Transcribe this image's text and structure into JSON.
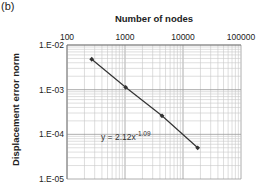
{
  "panel_label": "(b)",
  "chart_data": {
    "type": "line",
    "title": "",
    "xlabel": "Number of nodes",
    "ylabel": "Displacement error norm",
    "xscale": "log",
    "yscale": "log",
    "xlim": [
      100,
      100000
    ],
    "ylim": [
      1e-05,
      0.01
    ],
    "x_ticks": [
      "100",
      "1000",
      "10000",
      "100000"
    ],
    "y_ticks": [
      "1.E-02",
      "1.E-03",
      "1.E-04",
      "1.E-05"
    ],
    "grid": true,
    "legend": null,
    "series": [
      {
        "name": "Displacement error",
        "x": [
          267,
          1025,
          4350,
          17900
        ],
        "y": [
          0.0048,
          0.00113,
          0.00026,
          5e-05
        ],
        "marker": "diamond",
        "color": "#333333"
      }
    ],
    "annotations": [
      {
        "text": "y = 2.12x",
        "superscript": "-1.09",
        "x": 1000,
        "y": 8e-05
      }
    ]
  }
}
